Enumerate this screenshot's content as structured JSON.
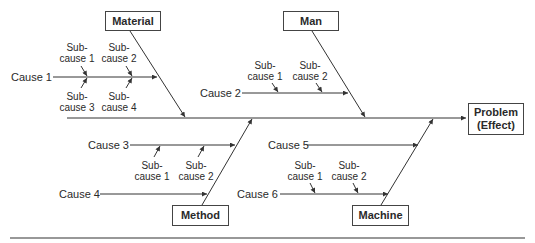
{
  "diagram": {
    "type": "fishbone",
    "effect": {
      "line1": "Problem",
      "line2": "(Effect)"
    },
    "categories": {
      "material": "Material",
      "man": "Man",
      "method": "Method",
      "machine": "Machine"
    },
    "causes": {
      "c1": "Cause 1",
      "c2": "Cause 2",
      "c3": "Cause 3",
      "c4": "Cause 4",
      "c5": "Cause 5",
      "c6": "Cause 6"
    },
    "subcauses": {
      "c1": [
        {
          "l1": "Sub-",
          "l2": "cause 1"
        },
        {
          "l1": "Sub-",
          "l2": "cause 2"
        },
        {
          "l1": "Sub-",
          "l2": "cause 3"
        },
        {
          "l1": "Sub-",
          "l2": "cause 4"
        }
      ],
      "c2": [
        {
          "l1": "Sub-",
          "l2": "cause 1"
        },
        {
          "l1": "Sub-",
          "l2": "cause 2"
        }
      ],
      "c3": [
        {
          "l1": "Sub-",
          "l2": "cause 1"
        },
        {
          "l1": "Sub-",
          "l2": "cause 2"
        }
      ],
      "c6": [
        {
          "l1": "Sub-",
          "l2": "cause 1"
        },
        {
          "l1": "Sub-",
          "l2": "cause 2"
        }
      ]
    },
    "colors": {
      "line": "#333333",
      "text": "#2a2a2a",
      "background": "#ffffff"
    }
  }
}
